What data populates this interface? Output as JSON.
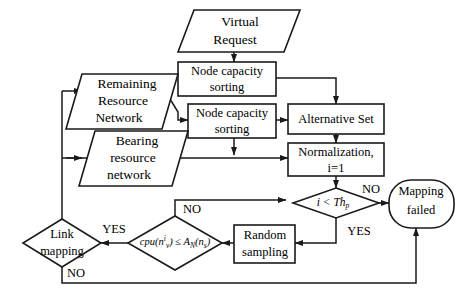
{
  "diagram": {
    "type": "flowchart",
    "nodes": {
      "virtual_request": {
        "label_line1": "Virtual",
        "label_line2": "Request",
        "shape": "parallelogram"
      },
      "node_capacity_sorting_1": {
        "label_line1": "Node capacity",
        "label_line2": "sorting",
        "shape": "rectangle"
      },
      "node_capacity_sorting_2": {
        "label_line1": "Node capacity",
        "label_line2": "sorting",
        "shape": "rectangle"
      },
      "remaining_resource_network": {
        "label_line1": "Remaining",
        "label_line2": "Resource",
        "label_line3": "Network",
        "shape": "parallelogram"
      },
      "bearing_resource_network": {
        "label_line1": "Bearing",
        "label_line2": "resource",
        "label_line3": "network",
        "shape": "parallelogram"
      },
      "alternative_set": {
        "label_line1": "Alternative Set",
        "shape": "rectangle"
      },
      "normalization": {
        "label_line1": "Normalization,",
        "label_line2": "i=1",
        "shape": "rectangle"
      },
      "threshold_decision": {
        "label_main": "i < Th",
        "label_sub": "p",
        "shape": "diamond"
      },
      "mapping_failed": {
        "label_line1": "Mapping",
        "label_line2": "failed",
        "shape": "stadium"
      },
      "random_sampling": {
        "label_line1": "Random",
        "label_line2": "sampling",
        "shape": "rectangle"
      },
      "cpu_constraint": {
        "label_main": "cpu(n",
        "label_sup": "i",
        "label_sub1": "v",
        "label_mid": ") ≤ A",
        "label_sub2": "N",
        "label_tail": "(n",
        "label_sub3": "s",
        "label_end": ")",
        "shape": "diamond"
      },
      "link_mapping": {
        "label_line1": "Link",
        "label_line2": "mapping",
        "shape": "diamond"
      }
    },
    "edge_labels": {
      "threshold_no": "NO",
      "threshold_yes": "YES",
      "cpu_no": "NO",
      "cpu_yes": "YES",
      "link_no": "NO"
    },
    "colors": {
      "stroke": "#1a1a1a",
      "fill": "#ffffff",
      "background": "#ffffff"
    }
  }
}
